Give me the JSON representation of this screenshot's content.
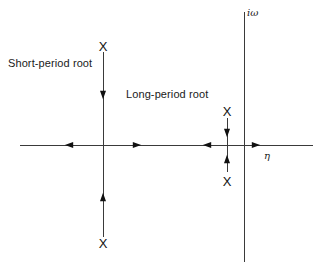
{
  "figure": {
    "width": 321,
    "height": 273,
    "background": "#ffffff",
    "line_color": "#3a3a3a",
    "text_color": "#1a1a1a"
  },
  "axes": {
    "real": {
      "name": "eta-axis",
      "label": "η",
      "label_x": 264,
      "label_y": 151,
      "y": 145,
      "x_start": 20,
      "x_end": 313
    },
    "imaginary": {
      "name": "i-omega-axis",
      "label": "iω",
      "label_x": 247,
      "label_y": 8,
      "x": 244,
      "y_start": 12,
      "y_end": 262
    }
  },
  "annotations": [
    {
      "id": "short-period",
      "text": "Short-period root",
      "x": 8,
      "y": 58
    },
    {
      "id": "long-period",
      "text": "Long-period root",
      "x": 126,
      "y": 89
    }
  ],
  "loci": [
    {
      "id": "short-period-locus",
      "x": 103,
      "y_top": 52,
      "y_bottom": 237,
      "pole_marker": "X",
      "poles": [
        {
          "x": 103,
          "y": 46
        },
        {
          "x": 103,
          "y": 243
        }
      ],
      "arrows": [
        {
          "x": 103,
          "y": 95,
          "direction": "down"
        },
        {
          "x": 103,
          "y": 197,
          "direction": "up"
        }
      ]
    },
    {
      "id": "long-period-locus",
      "x": 227,
      "y_top": 118,
      "y_bottom": 172,
      "pole_marker": "X",
      "poles": [
        {
          "x": 227,
          "y": 111
        },
        {
          "x": 227,
          "y": 181
        }
      ],
      "arrows": [
        {
          "x": 227,
          "y": 133,
          "direction": "down"
        },
        {
          "x": 227,
          "y": 159,
          "direction": "up"
        }
      ]
    }
  ],
  "real_axis_arrows": [
    {
      "x": 69,
      "y": 145,
      "direction": "left"
    },
    {
      "x": 137,
      "y": 145,
      "direction": "right"
    },
    {
      "x": 207,
      "y": 145,
      "direction": "left"
    },
    {
      "x": 256,
      "y": 145,
      "direction": "right"
    }
  ]
}
